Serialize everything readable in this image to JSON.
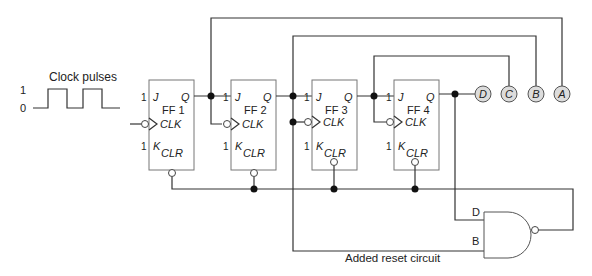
{
  "diagram": {
    "clock": {
      "label": "Clock pulses",
      "level_high": "1",
      "level_low": "0"
    },
    "flip_flops": [
      {
        "name": "FF 1",
        "j": "J",
        "k": "K",
        "q": "Q",
        "clk": "CLK",
        "clr": "CLR",
        "j_level": "1",
        "k_level": "1"
      },
      {
        "name": "FF 2",
        "j": "J",
        "k": "K",
        "q": "Q",
        "clk": "CLK",
        "clr": "CLR",
        "j_level": "1",
        "k_level": "1"
      },
      {
        "name": "FF 3",
        "j": "J",
        "k": "K",
        "q": "Q",
        "clk": "CLK",
        "clr": "CLR",
        "j_level": "1",
        "k_level": "1"
      },
      {
        "name": "FF 4",
        "j": "J",
        "k": "K",
        "q": "Q",
        "clk": "CLK",
        "clr": "CLR",
        "j_level": "1",
        "k_level": "1"
      }
    ],
    "outputs": [
      "D",
      "C",
      "B",
      "A"
    ],
    "nand_gate": {
      "input_top": "D",
      "input_bottom": "B"
    },
    "reset_label": "Added reset circuit",
    "colors": {
      "wire": "#333333",
      "box_border": "#777777",
      "output_fill": "#dcdcdc"
    }
  }
}
